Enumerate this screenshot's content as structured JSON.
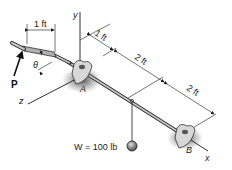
{
  "diagram": {
    "type": "engineering-statics-figure",
    "axes": {
      "x": "x",
      "y": "y",
      "z": "z"
    },
    "supports": [
      {
        "id": "A",
        "label": "A"
      },
      {
        "id": "B",
        "label": "B"
      }
    ],
    "force": {
      "label": "P",
      "angle_label": "θ"
    },
    "weight": {
      "label": "W = 100 lb"
    },
    "dimensions": [
      {
        "id": "handle",
        "label": "1 ft"
      },
      {
        "id": "a-offset",
        "label": "1 ft"
      },
      {
        "id": "mid-1",
        "label": "2 ft"
      },
      {
        "id": "mid-2",
        "label": "2 ft"
      }
    ],
    "colors": {
      "line": "#1a1a1a",
      "shaft": "#9a9a9a",
      "shadow": "#555555",
      "ball": "#8a8a8a"
    }
  }
}
